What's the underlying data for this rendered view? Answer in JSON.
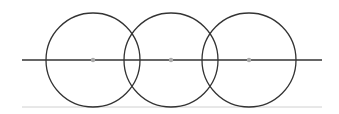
{
  "diagram": {
    "colors": {
      "stroke": "#333333",
      "center_point": "#aaaaaa",
      "baseline": "#d0d0d0",
      "background": "#ffffff"
    },
    "axis_line": {
      "x1": 22,
      "x2": 322,
      "y": 60
    },
    "baseline": {
      "x1": 22,
      "x2": 322,
      "y": 107
    },
    "circles": [
      {
        "cx": 93,
        "cy": 60,
        "r": 47
      },
      {
        "cx": 171,
        "cy": 60,
        "r": 47
      },
      {
        "cx": 249,
        "cy": 60,
        "r": 47
      }
    ]
  }
}
